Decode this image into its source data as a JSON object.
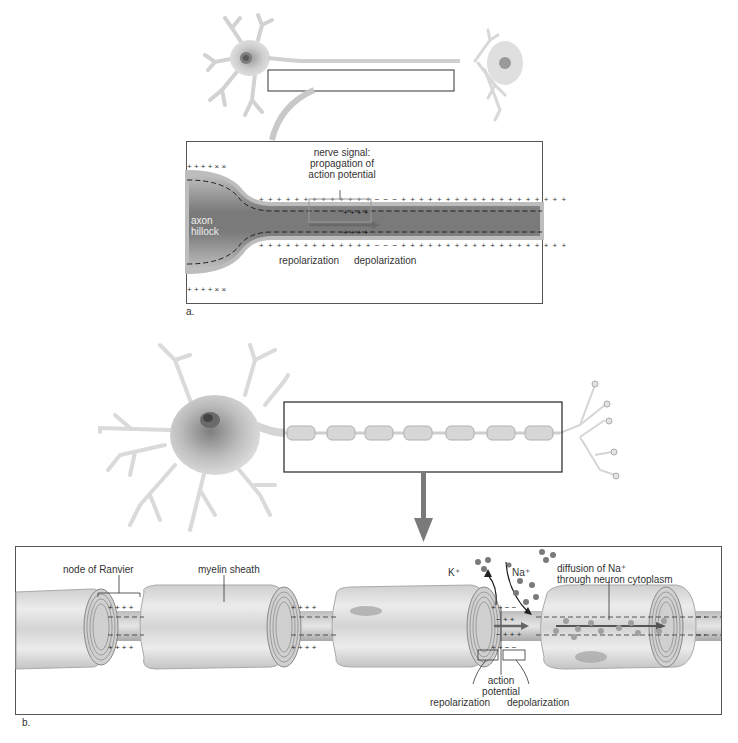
{
  "panel_a": {
    "letter": "a.",
    "labels": {
      "nerve_signal_line1": "nerve signal:",
      "nerve_signal_line2": "propagation of",
      "nerve_signal_line3": "action potential",
      "axon_hillock_line1": "axon",
      "axon_hillock_line2": "hillock",
      "repolarization": "repolarization",
      "depolarization": "depolarization"
    }
  },
  "panel_b": {
    "letter": "b.",
    "labels": {
      "node_of_ranvier": "node of Ranvier",
      "myelin_sheath": "myelin sheath",
      "k_ion": "K⁺",
      "na_ion": "Na⁺",
      "diffusion_line1": "diffusion of Na⁺",
      "diffusion_line2": "through neuron cytoplasm",
      "action_potential_line1": "action",
      "action_potential_line2": "potential",
      "repolarization": "repolarization",
      "depolarization": "depolarization"
    },
    "myelin_segments_in_overview": 7
  },
  "colors": {
    "neuron_fill": "#d9d9d9",
    "neuron_dark": "#8a8a8a",
    "axon_dark": "#6e6e6e",
    "frame": "#444444",
    "arrow": "#808080",
    "ion": "#7a7a7a"
  }
}
